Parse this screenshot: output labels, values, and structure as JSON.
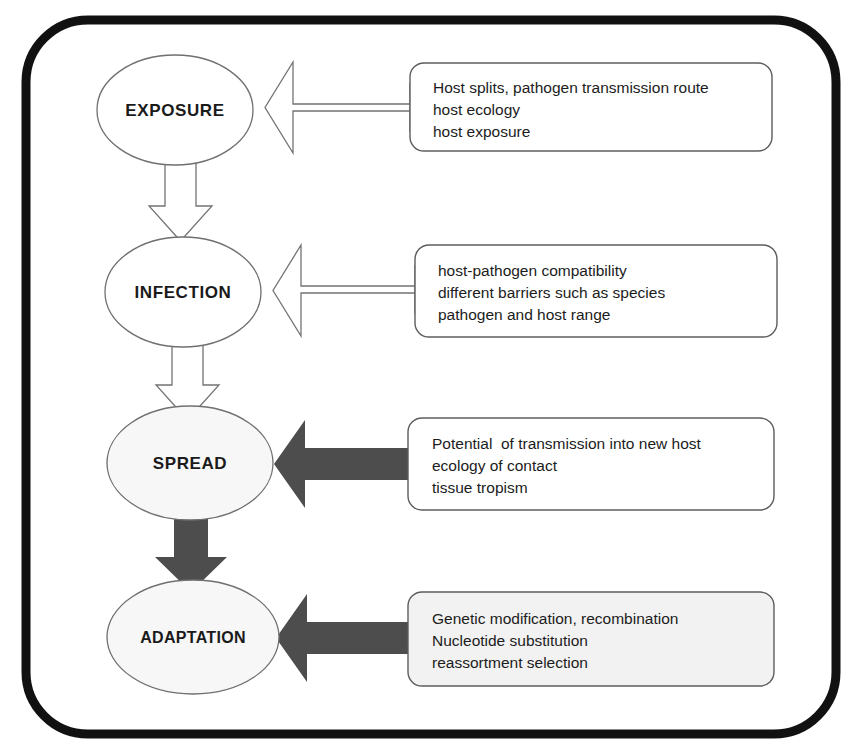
{
  "figure": {
    "background_color": "#ffffff",
    "frame": {
      "name": "outer-rounded-frame",
      "color": "#111111",
      "stroke_width": 9,
      "corner_radius": 62,
      "x": 26,
      "y": 20,
      "width": 810,
      "height": 714
    }
  },
  "palette": {
    "frame_black": "#111111",
    "solid_arrow_gray": "#4d4d4d",
    "hollow_arrow_outline": "#737373",
    "ellipse_outline": "#6f6f6f",
    "box_outline": "#5d5d5d",
    "white_fill": "#ffffff",
    "light_gray_fill": "#f2f2f2",
    "text_black": "#1c1c1c"
  },
  "stages": [
    {
      "id": "exposure",
      "label": "EXPOSURE",
      "cx": 175,
      "cy": 110,
      "rx": 78,
      "ry": 55,
      "fill": "#ffffff"
    },
    {
      "id": "infection",
      "label": "INFECTION",
      "cx": 183,
      "cy": 292,
      "rx": 78,
      "ry": 55,
      "fill": "#ffffff"
    },
    {
      "id": "spread",
      "label": "SPREAD",
      "cx": 190,
      "cy": 463,
      "rx": 83,
      "ry": 57,
      "fill": "#f7f7f7"
    },
    {
      "id": "adaptation",
      "label": "ADAPTATION",
      "cx": 193,
      "cy": 637,
      "rx": 86,
      "ry": 57,
      "fill": "#f7f7f7"
    }
  ],
  "factor_boxes": [
    {
      "id": "exposure-factors",
      "target_stage": "exposure",
      "fill": "#ffffff",
      "x": 410,
      "y": 63,
      "width": 362,
      "height": 88,
      "lines": [
        "Host splits, pathogen transmission route",
        "host ecology",
        "host exposure"
      ]
    },
    {
      "id": "infection-factors",
      "target_stage": "infection",
      "fill": "#ffffff",
      "x": 415,
      "y": 245,
      "width": 362,
      "height": 92,
      "lines": [
        "host-pathogen compatibility",
        "different barriers such as species",
        "pathogen and host range"
      ]
    },
    {
      "id": "spread-factors",
      "target_stage": "spread",
      "fill": "#ffffff",
      "x": 408,
      "y": 418,
      "width": 366,
      "height": 92,
      "lines": [
        "Potential  of transmission into new host",
        "ecology of contact",
        "tissue tropism"
      ]
    },
    {
      "id": "adaptation-factors",
      "target_stage": "adaptation",
      "fill": "#f2f2f2",
      "x": 408,
      "y": 592,
      "width": 366,
      "height": 94,
      "lines": [
        "Genetic modification, recombination",
        "Nucleotide substitution",
        "reassortment selection"
      ]
    }
  ],
  "horizontal_arrows": [
    {
      "id": "arrow-to-exposure",
      "style": "hollow",
      "from": "exposure-factors",
      "to": "exposure"
    },
    {
      "id": "arrow-to-infection",
      "style": "hollow",
      "from": "infection-factors",
      "to": "infection"
    },
    {
      "id": "arrow-to-spread",
      "style": "solid",
      "from": "spread-factors",
      "to": "spread"
    },
    {
      "id": "arrow-to-adaptation",
      "style": "solid",
      "from": "adaptation-factors",
      "to": "adaptation"
    }
  ],
  "vertical_arrows": [
    {
      "id": "arrow-exposure-to-infection",
      "style": "hollow",
      "from": "exposure",
      "to": "infection"
    },
    {
      "id": "arrow-infection-to-spread",
      "style": "hollow",
      "from": "infection",
      "to": "spread"
    },
    {
      "id": "arrow-spread-to-adaptation",
      "style": "solid",
      "from": "spread",
      "to": "adaptation"
    }
  ]
}
